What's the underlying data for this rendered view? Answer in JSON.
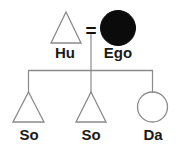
{
  "diagram": {
    "type": "kinship-chart",
    "title": "",
    "background_color": "#ffffff",
    "line_color": "#808080",
    "text_color": "#1a1a1a",
    "fill_color": "#000000",
    "union": {
      "symbol": "=",
      "name": "marriage-union-symbol"
    },
    "parents": [
      {
        "id": "hu",
        "label": "Hu",
        "shape": "triangle",
        "shape_semantic": "male-triangle",
        "filled": false,
        "role": "husband"
      },
      {
        "id": "ego",
        "label": "Ego",
        "shape": "circle",
        "shape_semantic": "female-circle",
        "filled": true,
        "role": "ego"
      }
    ],
    "children": [
      {
        "id": "so1",
        "label": "So",
        "shape": "triangle",
        "shape_semantic": "male-triangle",
        "filled": false,
        "role": "son"
      },
      {
        "id": "so2",
        "label": "So",
        "shape": "triangle",
        "shape_semantic": "male-triangle",
        "filled": false,
        "role": "son"
      },
      {
        "id": "da",
        "label": "Da",
        "shape": "circle",
        "shape_semantic": "female-circle",
        "filled": false,
        "role": "daughter"
      }
    ]
  }
}
